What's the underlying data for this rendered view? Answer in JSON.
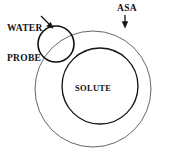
{
  "figure": {
    "background_color": "#ffffff",
    "line_color": "#000000",
    "labels": {
      "water_probe_line1": "WATER",
      "water_probe_line2": "PROBE",
      "asa": "ASA",
      "solute": "SOLUTE"
    },
    "shapes": [
      {
        "name": "asa-outer-circle",
        "kind": "circle",
        "cx": 93,
        "cy": 89,
        "r": 58,
        "stroke": "#555555",
        "stroke_width": 0.9,
        "fill": "none"
      },
      {
        "name": "solute-circle",
        "kind": "circle",
        "cx": 100,
        "cy": 86,
        "r": 38,
        "stroke": "#111111",
        "stroke_width": 1.3,
        "fill": "none"
      },
      {
        "name": "water-probe-circle",
        "kind": "circle",
        "cx": 56,
        "cy": 44,
        "r": 18,
        "stroke": "#111111",
        "stroke_width": 1.6,
        "fill": "none"
      }
    ],
    "arrows": [
      {
        "name": "water-probe-arrow",
        "x1": 41,
        "y1": 16,
        "x2": 52.5,
        "y2": 27.5
      },
      {
        "name": "asa-arrow",
        "x1": 125,
        "y1": 15,
        "x2": 125,
        "y2": 27
      }
    ]
  }
}
